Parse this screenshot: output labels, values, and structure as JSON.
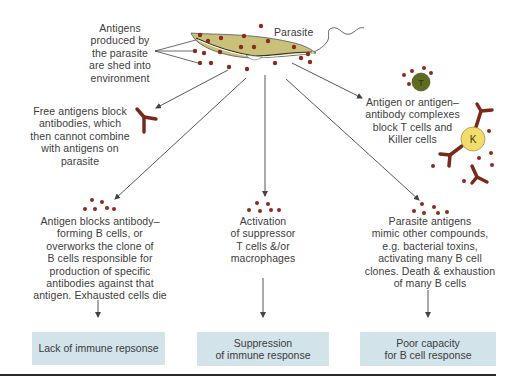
{
  "labels": {
    "antigens_shed": "Antigens\nproduced by\nthe parasite\nare shed into\nenvironment",
    "parasite": "Parasite",
    "free_antigens": "Free antigens block\nantibodies, which\nthen cannot combine\nwith antigens on\nparasite",
    "complexes": "Antigen or antigen–\nantibody complexes\nblock T cells and\nKiller cells",
    "b_cell_block": "Antigen blocks antibody–\nforming B cells, or\noverworks the clone of\nB cells responsible for\nproduction of specific\nantibodies against that\nantigen. Exhausted cells die",
    "suppressor": "Activation\nof suppressor\nT cells &/or\nmacrophages",
    "mimic": "Parasite antigens\nmimic other compounds,\ne.g. bacterial toxins,\nactivating many B cell\nclones. Death & exhaustion\nof many B cells"
  },
  "cells": {
    "t_cell": "T",
    "killer_cell": "K"
  },
  "outcomes": [
    {
      "label": "Lack of immune repsonse"
    },
    {
      "label": "Suppression\nof immune response"
    },
    {
      "label": "Poor capacity\nfor B cell response"
    }
  ],
  "colors": {
    "antigen_dot": "#8b2a1e",
    "antibody": "#7a2a1a",
    "parasite_fill": "#c9c07a",
    "t_cell_fill": "#5e6b22",
    "killer_cell_fill": "#f2dc6a",
    "outcome_box": "#d2e3ea",
    "arrow": "#444444"
  }
}
